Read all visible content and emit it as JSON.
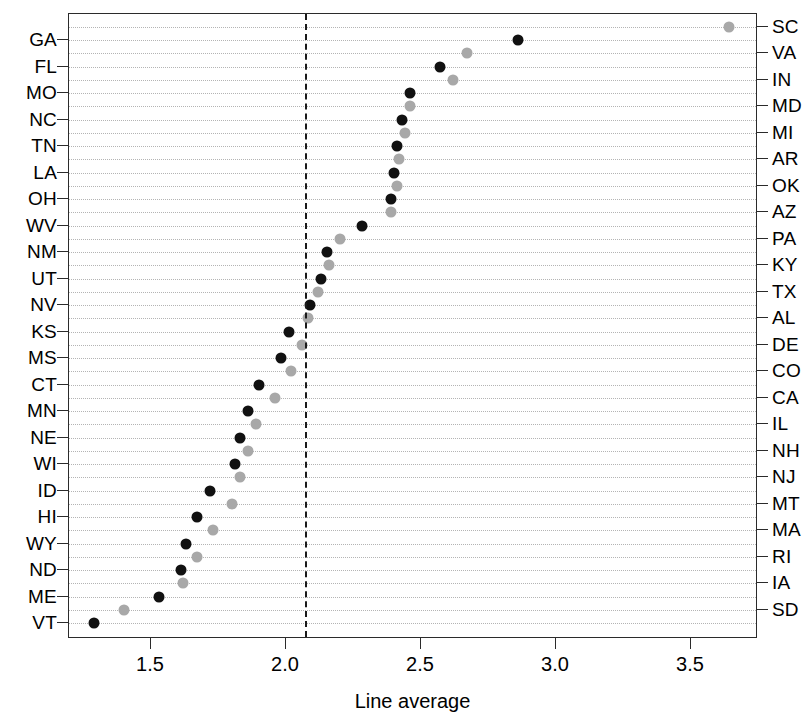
{
  "chart_data": {
    "type": "scatter",
    "title": "",
    "xlabel": "Line average",
    "ylabel": "",
    "xlim": [
      1.25,
      3.72
    ],
    "ylim": [
      0,
      45
    ],
    "grid": true,
    "legend_position": "none",
    "xticks": [
      "1.5",
      "2.0",
      "2.5",
      "3.0",
      "3.5"
    ],
    "xtick_values": [
      1.5,
      2.0,
      2.5,
      3.0,
      3.5
    ],
    "annotations": [
      {
        "name": "reference-line",
        "type": "vline",
        "value": 2.07,
        "style": "dashed",
        "color": "#1a1a1a"
      }
    ],
    "series": [
      {
        "name": "right-axis-states",
        "color": "#a8a8a8",
        "marker": "filled-circle",
        "labels": [
          "SC",
          "VA",
          "IN",
          "MD",
          "MI",
          "AR",
          "OK",
          "AZ",
          "PA",
          "KY",
          "TX",
          "AL",
          "DE",
          "CO",
          "CA",
          "IL",
          "NH",
          "NJ",
          "MT",
          "MA",
          "RI",
          "IA",
          "SD"
        ],
        "values": [
          3.64,
          2.67,
          2.62,
          2.46,
          2.44,
          2.42,
          2.41,
          2.39,
          2.35,
          2.2,
          2.16,
          2.12,
          2.08,
          2.06,
          2.02,
          1.96,
          1.89,
          1.86,
          1.83,
          1.8,
          1.73,
          1.67,
          1.62,
          1.4
        ]
      },
      {
        "name": "left-axis-states",
        "color": "#111111",
        "marker": "filled-circle",
        "labels": [
          "GA",
          "FL",
          "MO",
          "NC",
          "TN",
          "LA",
          "OH",
          "WV",
          "NM",
          "UT",
          "NV",
          "KS",
          "MS",
          "CT",
          "MN",
          "NE",
          "WI",
          "ID",
          "HI",
          "WY",
          "ND",
          "ME",
          "VT"
        ],
        "values": [
          2.86,
          2.57,
          2.46,
          2.43,
          2.41,
          2.4,
          2.39,
          2.28,
          2.15,
          2.13,
          2.09,
          2.01,
          1.98,
          1.9,
          1.86,
          1.83,
          1.81,
          1.72,
          1.67,
          1.63,
          1.61,
          1.53,
          1.29
        ]
      }
    ],
    "rows": [
      {
        "label": "SC",
        "side": "right",
        "color": "gray",
        "value": 3.64
      },
      {
        "label": "GA",
        "side": "left",
        "color": "black",
        "value": 2.86
      },
      {
        "label": "VA",
        "side": "right",
        "color": "gray",
        "value": 2.67
      },
      {
        "label": "FL",
        "side": "left",
        "color": "black",
        "value": 2.57
      },
      {
        "label": "IN",
        "side": "right",
        "color": "gray",
        "value": 2.62
      },
      {
        "label": "MO",
        "side": "left",
        "color": "black",
        "value": 2.46
      },
      {
        "label": "MD",
        "side": "right",
        "color": "gray",
        "value": 2.46
      },
      {
        "label": "NC",
        "side": "left",
        "color": "black",
        "value": 2.43
      },
      {
        "label": "MI",
        "side": "right",
        "color": "gray",
        "value": 2.44
      },
      {
        "label": "TN",
        "side": "left",
        "color": "black",
        "value": 2.41
      },
      {
        "label": "AR",
        "side": "right",
        "color": "gray",
        "value": 2.42
      },
      {
        "label": "LA",
        "side": "left",
        "color": "black",
        "value": 2.4
      },
      {
        "label": "OK",
        "side": "right",
        "color": "gray",
        "value": 2.41
      },
      {
        "label": "OH",
        "side": "left",
        "color": "black",
        "value": 2.39
      },
      {
        "label": "AZ",
        "side": "right",
        "color": "gray",
        "value": 2.39
      },
      {
        "label": "WV",
        "side": "left",
        "color": "black",
        "value": 2.28
      },
      {
        "label": "PA",
        "side": "right",
        "color": "gray",
        "value": 2.2
      },
      {
        "label": "NM",
        "side": "left",
        "color": "black",
        "value": 2.15
      },
      {
        "label": "KY",
        "side": "right",
        "color": "gray",
        "value": 2.16
      },
      {
        "label": "UT",
        "side": "left",
        "color": "black",
        "value": 2.13
      },
      {
        "label": "TX",
        "side": "right",
        "color": "gray",
        "value": 2.12
      },
      {
        "label": "NV",
        "side": "left",
        "color": "black",
        "value": 2.09
      },
      {
        "label": "AL",
        "side": "right",
        "color": "gray",
        "value": 2.08
      },
      {
        "label": "KS",
        "side": "left",
        "color": "black",
        "value": 2.01
      },
      {
        "label": "DE",
        "side": "right",
        "color": "gray",
        "value": 2.06
      },
      {
        "label": "MS",
        "side": "left",
        "color": "black",
        "value": 1.98
      },
      {
        "label": "CO",
        "side": "right",
        "color": "gray",
        "value": 2.02
      },
      {
        "label": "CT",
        "side": "left",
        "color": "black",
        "value": 1.9
      },
      {
        "label": "CA",
        "side": "right",
        "color": "gray",
        "value": 1.96
      },
      {
        "label": "MN",
        "side": "left",
        "color": "black",
        "value": 1.86
      },
      {
        "label": "IL",
        "side": "right",
        "color": "gray",
        "value": 1.89
      },
      {
        "label": "NE",
        "side": "left",
        "color": "black",
        "value": 1.83
      },
      {
        "label": "NH",
        "side": "right",
        "color": "gray",
        "value": 1.86
      },
      {
        "label": "WI",
        "side": "left",
        "color": "black",
        "value": 1.81
      },
      {
        "label": "NJ",
        "side": "right",
        "color": "gray",
        "value": 1.83
      },
      {
        "label": "ID",
        "side": "left",
        "color": "black",
        "value": 1.72
      },
      {
        "label": "MT",
        "side": "right",
        "color": "gray",
        "value": 1.8
      },
      {
        "label": "HI",
        "side": "left",
        "color": "black",
        "value": 1.67
      },
      {
        "label": "MA",
        "side": "right",
        "color": "gray",
        "value": 1.73
      },
      {
        "label": "WY",
        "side": "left",
        "color": "black",
        "value": 1.63
      },
      {
        "label": "RI",
        "side": "right",
        "color": "gray",
        "value": 1.67
      },
      {
        "label": "ND",
        "side": "left",
        "color": "black",
        "value": 1.61
      },
      {
        "label": "IA",
        "side": "right",
        "color": "gray",
        "value": 1.62
      },
      {
        "label": "ME",
        "side": "left",
        "color": "black",
        "value": 1.53
      },
      {
        "label": "SD",
        "side": "right",
        "color": "gray",
        "value": 1.4
      },
      {
        "label": "VT",
        "side": "left",
        "color": "black",
        "value": 1.29
      }
    ]
  }
}
